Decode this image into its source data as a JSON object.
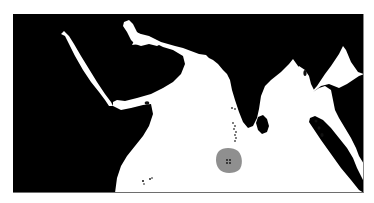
{
  "map": {
    "type": "regional-map",
    "region_depicted": "Indian Ocean",
    "colors": {
      "land": "#000000",
      "sea": "#ffffff",
      "highlight": "#8f8f8f",
      "frame_border": "#6e6e6e"
    },
    "features": [
      {
        "name": "arabian-peninsula",
        "kind": "land"
      },
      {
        "name": "horn-of-africa",
        "kind": "land"
      },
      {
        "name": "indian-subcontinent",
        "kind": "land"
      },
      {
        "name": "sri-lanka",
        "kind": "land"
      },
      {
        "name": "southeast-asia",
        "kind": "land"
      },
      {
        "name": "sumatra",
        "kind": "land"
      },
      {
        "name": "maldives",
        "kind": "island-chain"
      },
      {
        "name": "highlighted-area",
        "kind": "highlight"
      },
      {
        "name": "seychelles",
        "kind": "island-group"
      }
    ],
    "labels": []
  }
}
